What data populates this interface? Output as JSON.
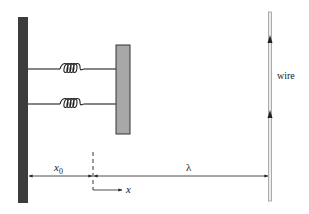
{
  "diagram": {
    "labels": {
      "wire": "wire",
      "x0_main": "x",
      "x0_sub": "0",
      "x": "x",
      "lambda": "λ"
    },
    "colors": {
      "wall": "#3c3c3c",
      "block_fill": "#a8a8a8",
      "block_stroke": "#333333",
      "wire_fill": "#ececec",
      "wire_stroke": "#9a9a9a",
      "line": "#222222"
    },
    "elements": {
      "springs": 2,
      "spring_coils": 4,
      "wire_current_arrows": 2
    }
  }
}
